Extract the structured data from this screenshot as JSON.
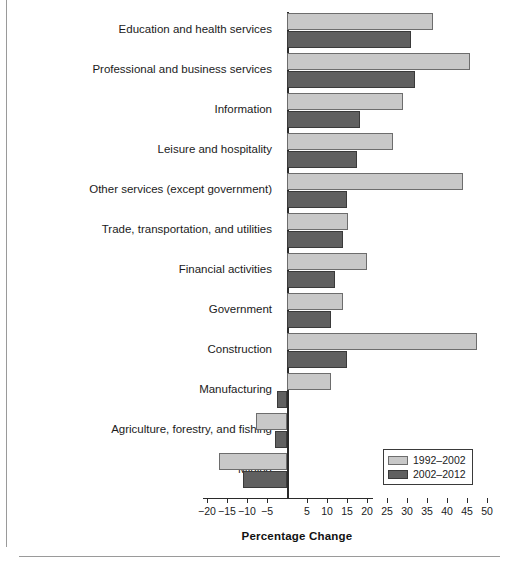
{
  "chart_data": {
    "type": "bar",
    "orientation": "horizontal",
    "title": "",
    "xlabel": "Percentage Change",
    "ylabel": "",
    "xlim": [
      -22,
      52
    ],
    "grid": false,
    "legend_position": "bottom-right",
    "xticks": [
      -20,
      -15,
      -10,
      -5,
      5,
      10,
      15,
      20,
      25,
      30,
      35,
      40,
      45,
      50
    ],
    "xticklabels": [
      "−20",
      "−15",
      "−10",
      "−5",
      "5",
      "10",
      "15",
      "20",
      "25",
      "30",
      "35",
      "40",
      "45",
      "50"
    ],
    "categories": [
      "Education and health services",
      "Professional and business services",
      "Information",
      "Leisure and hospitality",
      "Other services (except government)",
      "Trade, transportation, and utilities",
      "Financial activities",
      "Government",
      "Construction",
      "Manufacturing",
      "Agriculture, forestry, and fishing",
      "Mining"
    ],
    "series": [
      {
        "name": "1992–2002",
        "color": "#c8c8c8",
        "values": [
          36.5,
          45.8,
          29.0,
          26.5,
          44.0,
          15.2,
          20.0,
          14.0,
          47.5,
          11.0,
          -7.8,
          -17.0
        ]
      },
      {
        "name": "2002–2012",
        "color": "#606060",
        "values": [
          31.0,
          32.0,
          18.3,
          17.5,
          15.0,
          14.0,
          12.0,
          11.0,
          15.0,
          -2.5,
          -3.0,
          -11.0
        ]
      }
    ]
  }
}
